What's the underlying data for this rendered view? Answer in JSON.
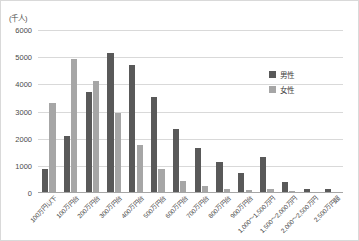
{
  "chart_data": {
    "type": "bar",
    "title": "",
    "xlabel": "",
    "ylabel": "(千人)",
    "unit_label": "(千人)",
    "ylim": [
      0,
      6000
    ],
    "ytick_step": 1000,
    "yticks": [
      "6000",
      "5000",
      "4000",
      "3000",
      "2000",
      "1000",
      "0"
    ],
    "grid": true,
    "legend_position": "right-inside",
    "categories": [
      "100万円以下",
      "100万円台",
      "200万円台",
      "300万円台",
      "400万円台",
      "500万円台",
      "600万円台",
      "700万円台",
      "800万円台",
      "900万円台",
      "1,000～1,500万円",
      "1,500～2,000万円",
      "2,000～2,500万円",
      "2,500万円超"
    ],
    "series": [
      {
        "name": "男性",
        "color": "#595959",
        "values": [
          900,
          2100,
          3700,
          5150,
          4730,
          3550,
          2350,
          1650,
          1150,
          750,
          1330,
          400,
          130,
          150
        ]
      },
      {
        "name": "女性",
        "color": "#a6a6a6",
        "values": [
          3300,
          4950,
          4120,
          2950,
          1750,
          900,
          450,
          250,
          150,
          100,
          160,
          60,
          30,
          40
        ]
      }
    ]
  }
}
